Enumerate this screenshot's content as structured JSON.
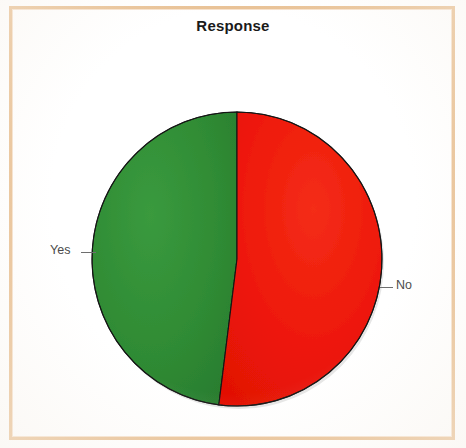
{
  "frame": {
    "border_color": "#e9c296",
    "background": "#ffffff"
  },
  "chart": {
    "title": "Response",
    "label_yes": "Yes",
    "label_no": "No"
  },
  "chart_data": {
    "type": "pie",
    "title": "Response",
    "categories": [
      "Yes",
      "No"
    ],
    "values": [
      48,
      52
    ],
    "labels": [
      "Yes",
      "No"
    ],
    "colors": [
      "#2f8b34",
      "#ee1809"
    ],
    "start_angle_deg": 0,
    "direction": "counterclockwise",
    "legend": "none",
    "label_position": "outside-with-leader-lines",
    "grid": false,
    "center_px": [
      237,
      259
    ],
    "radius_px": 145,
    "series": [
      {
        "name": "Response",
        "values": [
          48,
          52
        ]
      }
    ]
  },
  "colors": {
    "green_slice": "#2f8b34",
    "red_slice": "#ee1809",
    "slice_outline": "#141414",
    "title_text": "#1a1a1a",
    "label_text": "#4a4a4a",
    "leader_line": "#6e6e6e",
    "frame": "#e9c296"
  }
}
